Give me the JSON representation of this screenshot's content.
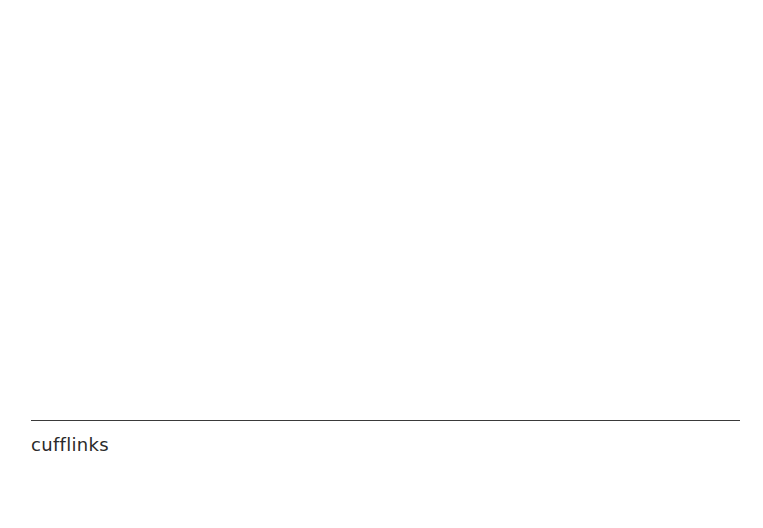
{
  "figure": {
    "caption": "cufflinks",
    "divider_color": "#3a3a3a",
    "text_color": "#2a2a2a",
    "background": "#ffffff"
  }
}
